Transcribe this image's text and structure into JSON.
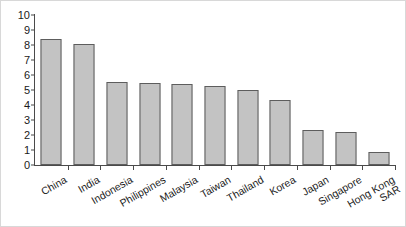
{
  "chart_data": {
    "type": "bar",
    "title": "",
    "subtitle": "",
    "xlabel": "",
    "ylabel": "",
    "ylim": [
      0,
      10
    ],
    "ytick_labels": [
      "10",
      "9",
      "8",
      "7",
      "6",
      "5",
      "4",
      "3",
      "2",
      "1",
      "0"
    ],
    "ytick_values": [
      10,
      9,
      8,
      7,
      6,
      5,
      4,
      3,
      2,
      1,
      0
    ],
    "grid": false,
    "legend": null,
    "bar_color": "#c3c3c3",
    "bar_border_color": "#5d5d5d",
    "axis_color": "#4a4a4a",
    "categories": [
      "China",
      "India",
      "Indonesia",
      "Philippines",
      "Malaysia",
      "Taiwan",
      "Thailand",
      "Korea",
      "Japan",
      "Singapore",
      "Hong Kong\nSAR"
    ],
    "values": [
      8.4,
      8.1,
      5.55,
      5.5,
      5.4,
      5.25,
      5.0,
      4.35,
      2.35,
      2.2,
      0.85
    ]
  }
}
